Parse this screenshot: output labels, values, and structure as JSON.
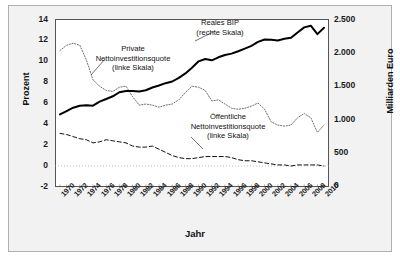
{
  "chart_data": {
    "type": "line",
    "title": "",
    "xlabel": "Jahr",
    "ylabel": "Prozent",
    "y2label": "Milliarden Euro",
    "grid": false,
    "legend_position": "inline-annotations",
    "ylim": [
      -2,
      14
    ],
    "y2lim": [
      0,
      2500
    ],
    "yticks": [
      "14",
      "12",
      "10",
      "8",
      "6",
      "4",
      "2",
      "0",
      "-2"
    ],
    "ytick_values": [
      14,
      12,
      10,
      8,
      6,
      4,
      2,
      0,
      -2
    ],
    "y2ticks": [
      "2.500",
      "2.000",
      "1.500",
      "1.000",
      "500",
      "0"
    ],
    "y2tick_values": [
      2500,
      2000,
      1500,
      1000,
      500,
      0
    ],
    "x": [
      1970,
      1971,
      1972,
      1973,
      1974,
      1975,
      1976,
      1977,
      1978,
      1979,
      1980,
      1981,
      1982,
      1983,
      1984,
      1985,
      1986,
      1987,
      1988,
      1989,
      1990,
      1991,
      1992,
      1993,
      1994,
      1995,
      1996,
      1997,
      1998,
      1999,
      2000,
      2001,
      2002,
      2003,
      2004,
      2005,
      2006,
      2007,
      2008,
      2009,
      2010
    ],
    "xtick_labels": [
      "1970",
      "1972",
      "1974",
      "1976",
      "1978",
      "1980",
      "1982",
      "1984",
      "1986",
      "1988",
      "1990",
      "1992",
      "1994",
      "1996",
      "1998",
      "2000",
      "2002",
      "2004",
      "2006",
      "2008",
      "2010"
    ],
    "series": [
      {
        "name": "Private Nettoinvestitionsquote (linke Skala)",
        "axis": "left",
        "style": "dotted",
        "unit": "Prozent",
        "values": [
          11.0,
          11.5,
          11.7,
          11.5,
          10.1,
          8.2,
          7.6,
          7.2,
          7.1,
          7.5,
          7.6,
          6.6,
          5.8,
          5.9,
          5.8,
          5.6,
          5.8,
          5.9,
          6.3,
          7.0,
          7.6,
          7.5,
          7.2,
          6.2,
          6.3,
          5.9,
          5.5,
          5.4,
          5.5,
          5.7,
          6.0,
          5.4,
          4.2,
          3.9,
          3.8,
          3.9,
          4.6,
          5.0,
          4.6,
          3.2,
          3.9
        ]
      },
      {
        "name": "Öffentliche Nettoinvestitionsquote (linke Skala)",
        "axis": "left",
        "style": "dashed",
        "unit": "Prozent",
        "values": [
          3.1,
          3.0,
          2.8,
          2.6,
          2.5,
          2.2,
          2.3,
          2.5,
          2.4,
          2.3,
          2.2,
          1.9,
          1.8,
          1.8,
          1.9,
          1.6,
          1.3,
          1.0,
          0.8,
          0.7,
          0.7,
          0.8,
          0.9,
          0.9,
          0.9,
          0.9,
          0.8,
          0.6,
          0.5,
          0.5,
          0.4,
          0.3,
          0.2,
          0.1,
          0.1,
          0.0,
          0.1,
          0.1,
          0.1,
          0.1,
          0.0
        ]
      },
      {
        "name": "Reales BIP (rechte Skala)",
        "axis": "right",
        "style": "solid",
        "unit": "Milliarden Euro",
        "values": [
          1080,
          1130,
          1180,
          1210,
          1215,
          1210,
          1270,
          1310,
          1350,
          1410,
          1430,
          1430,
          1420,
          1440,
          1480,
          1510,
          1545,
          1570,
          1625,
          1690,
          1775,
          1870,
          1905,
          1885,
          1930,
          1965,
          1985,
          2020,
          2060,
          2100,
          2160,
          2195,
          2190,
          2180,
          2205,
          2220,
          2300,
          2375,
          2400,
          2275,
          2370
        ]
      }
    ],
    "annotations": [
      {
        "id": "private",
        "lines": [
          "Private",
          "Nettoinvestitionsquote",
          "(linke Skala)"
        ]
      },
      {
        "id": "gdp",
        "lines": [
          "Reales BIP",
          "(rechte Skala)"
        ]
      },
      {
        "id": "public",
        "lines": [
          "Öffentliche",
          "Nettoinvestitionsquote",
          "(linke Skala)"
        ]
      }
    ]
  }
}
